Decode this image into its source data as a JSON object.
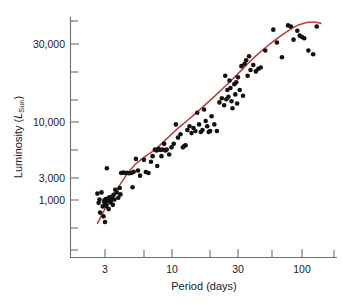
{
  "figure": {
    "name": "period-luminosity-scatter",
    "background_color": "#ffffff"
  },
  "chart_data": {
    "type": "scatter",
    "title": "",
    "xlabel": "Period (days)",
    "ylabel": "Luminosity (L_Sun)",
    "ylabel_main": "Luminosity (",
    "ylabel_symbol": "L",
    "ylabel_subscript": "Sun",
    "ylabel_close": ")",
    "xscale": "log",
    "yscale": "log",
    "xlim": [
      2.3,
      145
    ],
    "ylim": [
      480,
      62000
    ],
    "grid": false,
    "legend": null,
    "xticks": [
      3,
      10,
      30,
      100
    ],
    "xtick_labels": [
      "3",
      "10",
      "30",
      "100"
    ],
    "yticks": [
      1000,
      3000,
      10000,
      30000
    ],
    "ytick_labels": [
      "1,000",
      "3,000",
      "10,000",
      "30,000"
    ],
    "yticks_minor": [
      600,
      2000,
      6000,
      20000,
      60000
    ],
    "xticks_minor": [
      5,
      20,
      50
    ],
    "marker_color": "#111111",
    "marker_size_px": 4.6,
    "fit_curve_color": "#bb3b3b",
    "axis_color": "#6e6e6e",
    "series": [
      {
        "name": "Cepheid variables",
        "points": [
          [
            2.62,
            1150
          ],
          [
            2.68,
            940
          ],
          [
            2.72,
            1010
          ],
          [
            2.75,
            760
          ],
          [
            2.82,
            1180
          ],
          [
            2.88,
            870
          ],
          [
            2.92,
            700
          ],
          [
            2.95,
            960
          ],
          [
            2.98,
            1000
          ],
          [
            3.0,
            620
          ],
          [
            3.02,
            900
          ],
          [
            3.05,
            1020
          ],
          [
            3.08,
            880
          ],
          [
            3.1,
            980
          ],
          [
            3.15,
            1030
          ],
          [
            3.2,
            820
          ],
          [
            3.25,
            1060
          ],
          [
            3.3,
            950
          ],
          [
            3.35,
            1000
          ],
          [
            3.4,
            1080
          ],
          [
            3.45,
            900
          ],
          [
            3.5,
            1120
          ],
          [
            3.55,
            1010
          ],
          [
            3.6,
            1250
          ],
          [
            3.7,
            1180
          ],
          [
            3.8,
            1050
          ],
          [
            3.9,
            1300
          ],
          [
            3.95,
            1130
          ],
          [
            3.1,
            2000
          ],
          [
            4.0,
            1800
          ],
          [
            4.15,
            1820
          ],
          [
            4.3,
            1800
          ],
          [
            4.45,
            1810
          ],
          [
            4.6,
            1790
          ],
          [
            4.8,
            1800
          ],
          [
            4.9,
            1320
          ],
          [
            5.0,
            1850
          ],
          [
            5.2,
            2450
          ],
          [
            5.4,
            1900
          ],
          [
            5.6,
            1700
          ],
          [
            6.0,
            2400
          ],
          [
            6.2,
            1840
          ],
          [
            6.5,
            1800
          ],
          [
            6.8,
            2300
          ],
          [
            7.0,
            2600
          ],
          [
            7.3,
            3000
          ],
          [
            7.5,
            2950
          ],
          [
            7.6,
            2100
          ],
          [
            7.8,
            3050
          ],
          [
            8.0,
            2980
          ],
          [
            8.2,
            2600
          ],
          [
            8.4,
            3000
          ],
          [
            8.6,
            3400
          ],
          [
            8.8,
            2950
          ],
          [
            9.0,
            3000
          ],
          [
            9.4,
            2700
          ],
          [
            9.8,
            3150
          ],
          [
            10.2,
            3400
          ],
          [
            10.6,
            5200
          ],
          [
            11.0,
            3900
          ],
          [
            11.5,
            4200
          ],
          [
            12.0,
            3150
          ],
          [
            12.3,
            3250
          ],
          [
            12.6,
            3300
          ],
          [
            13.0,
            4600
          ],
          [
            13.5,
            5000
          ],
          [
            14.0,
            4300
          ],
          [
            14.5,
            4800
          ],
          [
            15.0,
            4500
          ],
          [
            15.5,
            6700
          ],
          [
            16.0,
            5200
          ],
          [
            16.5,
            4400
          ],
          [
            17.0,
            4600
          ],
          [
            17.5,
            7200
          ],
          [
            18.0,
            5600
          ],
          [
            18.5,
            5000
          ],
          [
            19.0,
            4400
          ],
          [
            19.5,
            4500
          ],
          [
            20.0,
            6200
          ],
          [
            21.0,
            5200
          ],
          [
            22.0,
            4500
          ],
          [
            23.0,
            8400
          ],
          [
            24.0,
            9200
          ],
          [
            25.0,
            7900
          ],
          [
            25.5,
            15000
          ],
          [
            26.0,
            9000
          ],
          [
            26.5,
            11000
          ],
          [
            27.0,
            9500
          ],
          [
            27.5,
            13500
          ],
          [
            28.0,
            11500
          ],
          [
            28.5,
            8600
          ],
          [
            29.0,
            7400
          ],
          [
            30.0,
            12500
          ],
          [
            30.5,
            10000
          ],
          [
            31.0,
            13000
          ],
          [
            31.5,
            8200
          ],
          [
            32.0,
            14500
          ],
          [
            33.0,
            11000
          ],
          [
            34.0,
            18500
          ],
          [
            35.0,
            9700
          ],
          [
            36.0,
            19500
          ],
          [
            37.0,
            21000
          ],
          [
            38.0,
            15000
          ],
          [
            39.0,
            23000
          ],
          [
            40.0,
            17000
          ],
          [
            42.0,
            19000
          ],
          [
            44.0,
            16500
          ],
          [
            46.0,
            17500
          ],
          [
            48.0,
            18000
          ],
          [
            52.0,
            26000
          ],
          [
            60.0,
            41000
          ],
          [
            64.0,
            31000
          ],
          [
            70.0,
            22500
          ],
          [
            78.0,
            45000
          ],
          [
            82.0,
            44000
          ],
          [
            86.0,
            33000
          ],
          [
            92.0,
            40000
          ],
          [
            96.0,
            36000
          ],
          [
            100.0,
            35000
          ],
          [
            104.0,
            34000
          ],
          [
            112.0,
            26000
          ],
          [
            122.0,
            24000
          ],
          [
            130.0,
            44000
          ]
        ]
      }
    ],
    "fit_curve": {
      "name": "period-luminosity-fit",
      "description": "smooth red best-fit curve through the scatter",
      "points": [
        [
          2.62,
          600
        ],
        [
          2.8,
          700
        ],
        [
          3.0,
          830
        ],
        [
          3.3,
          1000
        ],
        [
          3.7,
          1250
        ],
        [
          4.2,
          1600
        ],
        [
          4.8,
          2000
        ],
        [
          5.5,
          2350
        ],
        [
          6.3,
          2650
        ],
        [
          7.2,
          2950
        ],
        [
          8.2,
          3400
        ],
        [
          9.4,
          4000
        ],
        [
          10.8,
          4700
        ],
        [
          12.4,
          5400
        ],
        [
          14.2,
          6200
        ],
        [
          16.3,
          7200
        ],
        [
          18.7,
          8400
        ],
        [
          21.5,
          9800
        ],
        [
          24.7,
          11500
        ],
        [
          28.3,
          13500
        ],
        [
          32.5,
          16000
        ],
        [
          37.3,
          19000
        ],
        [
          42.8,
          22500
        ],
        [
          49.1,
          26000
        ],
        [
          56.4,
          30000
        ],
        [
          64.7,
          34000
        ],
        [
          74.3,
          38500
        ],
        [
          85.3,
          43000
        ],
        [
          97.9,
          46500
        ],
        [
          112.3,
          48500
        ],
        [
          129.0,
          48500
        ],
        [
          140.0,
          47000
        ]
      ]
    }
  },
  "caption": {
    "partial_text": ""
  }
}
